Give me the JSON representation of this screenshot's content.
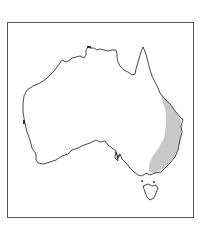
{
  "map": {
    "title": "",
    "region": "Australia",
    "highlighted_range": "Eastern Australia (east coast, Queensland to Victoria)",
    "colors": {
      "frame": "#555555",
      "outline": "#333333",
      "range_fill": "#c8c8c8",
      "land": "#ffffff"
    }
  }
}
